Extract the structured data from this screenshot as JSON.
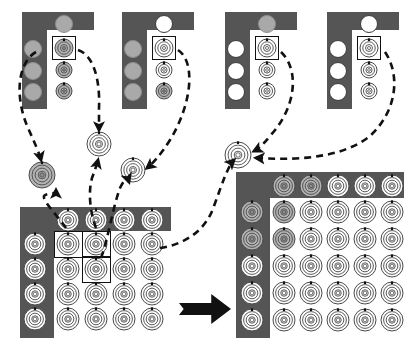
{
  "figure": {
    "type": "process-diagram",
    "canvas": {
      "width": 414,
      "height": 347
    },
    "background": "#ffffff"
  },
  "colors": {
    "panel_dark": "#555556",
    "panel_light": "#ffffff",
    "circle_gray": "#a9a9aa",
    "circle_white": "#ffffff",
    "ring_stroke": "#4a4a4a",
    "ring_fill_gray": "#b3b3b4",
    "ring_fill_white": "#ffffff",
    "arrow_black": "#111111",
    "selection_box": "#111111"
  },
  "legend_glyphs": {
    "plain_circle": "filled-circle",
    "ring_node": "concentric-ring-node",
    "ellipsis": "...",
    "transform_arrow": "thick-right-arrow"
  },
  "panels": [
    {
      "id": "panel-1",
      "label": "candidate-panel-1",
      "x": 22,
      "y": 12,
      "w": 72,
      "h": 97,
      "white_x": 25,
      "white_y": 18,
      "white_w": 47,
      "white_h": 79,
      "column_dots": [
        {
          "style": "gray",
          "cx": 11,
          "cy": 37,
          "r": 9
        },
        {
          "style": "gray",
          "cx": 11,
          "cy": 59,
          "r": 9
        },
        {
          "style": "gray",
          "cx": 11,
          "cy": 80,
          "r": 9
        }
      ],
      "top_dot": {
        "style": "gray",
        "cx": 42,
        "cy": 12,
        "r": 9
      },
      "ring_nodes": [
        {
          "fill": "gray",
          "cx": 42,
          "cy": 36,
          "r": 9,
          "selected": true
        },
        {
          "fill": "gray",
          "cx": 42,
          "cy": 58,
          "r": 8
        },
        {
          "fill": "gray",
          "cx": 42,
          "cy": 79,
          "r": 8
        }
      ],
      "ellipsis_dark": {
        "x": 3,
        "y": 88
      },
      "ellipsis_light": {
        "x": 34,
        "y": 87
      }
    },
    {
      "id": "panel-2",
      "label": "candidate-panel-2",
      "x": 122,
      "y": 12,
      "w": 72,
      "h": 97,
      "white_x": 25,
      "white_y": 18,
      "white_w": 47,
      "white_h": 79,
      "column_dots": [
        {
          "style": "gray",
          "cx": 11,
          "cy": 37,
          "r": 9
        },
        {
          "style": "gray",
          "cx": 11,
          "cy": 59,
          "r": 9
        },
        {
          "style": "gray",
          "cx": 11,
          "cy": 80,
          "r": 9
        }
      ],
      "top_dot": {
        "style": "white",
        "cx": 42,
        "cy": 12,
        "r": 9
      },
      "ring_nodes": [
        {
          "fill": "white",
          "cx": 42,
          "cy": 36,
          "r": 9,
          "selected": true
        },
        {
          "fill": "white",
          "cx": 42,
          "cy": 58,
          "r": 8
        },
        {
          "fill": "gray",
          "cx": 42,
          "cy": 79,
          "r": 8
        }
      ],
      "ellipsis_dark": {
        "x": 3,
        "y": 88
      },
      "ellipsis_light": {
        "x": 34,
        "y": 87
      }
    },
    {
      "id": "panel-3",
      "label": "candidate-panel-3",
      "x": 225,
      "y": 12,
      "w": 72,
      "h": 97,
      "white_x": 25,
      "white_y": 18,
      "white_w": 47,
      "white_h": 79,
      "column_dots": [
        {
          "style": "white",
          "cx": 11,
          "cy": 37,
          "r": 9
        },
        {
          "style": "white",
          "cx": 11,
          "cy": 59,
          "r": 9
        },
        {
          "style": "white",
          "cx": 11,
          "cy": 80,
          "r": 9
        }
      ],
      "top_dot": {
        "style": "gray",
        "cx": 42,
        "cy": 12,
        "r": 9
      },
      "ring_nodes": [
        {
          "fill": "white",
          "cx": 42,
          "cy": 36,
          "r": 9,
          "selected": true
        },
        {
          "fill": "white",
          "cx": 42,
          "cy": 58,
          "r": 8
        },
        {
          "fill": "white",
          "cx": 42,
          "cy": 79,
          "r": 8
        }
      ],
      "ellipsis_dark": {
        "x": 3,
        "y": 88
      },
      "ellipsis_light": {
        "x": 34,
        "y": 87
      }
    },
    {
      "id": "panel-4",
      "label": "candidate-panel-4",
      "x": 327,
      "y": 12,
      "w": 72,
      "h": 97,
      "white_x": 25,
      "white_y": 18,
      "white_w": 47,
      "white_h": 79,
      "column_dots": [
        {
          "style": "white",
          "cx": 11,
          "cy": 37,
          "r": 9
        },
        {
          "style": "white",
          "cx": 11,
          "cy": 59,
          "r": 9
        },
        {
          "style": "white",
          "cx": 11,
          "cy": 80,
          "r": 9
        }
      ],
      "top_dot": {
        "style": "white",
        "cx": 42,
        "cy": 12,
        "r": 9
      },
      "ring_nodes": [
        {
          "fill": "white",
          "cx": 42,
          "cy": 36,
          "r": 9,
          "selected": true
        },
        {
          "fill": "white",
          "cx": 42,
          "cy": 58,
          "r": 8
        },
        {
          "fill": "white",
          "cx": 42,
          "cy": 79,
          "r": 8
        }
      ],
      "ellipsis_dark": {
        "x": 3,
        "y": 88
      },
      "ellipsis_light": {
        "x": 34,
        "y": 87
      }
    }
  ],
  "intermediate_nodes": [
    {
      "id": "node-a",
      "label": "selected-node-a",
      "cx": 42,
      "cy": 175,
      "r": 13,
      "fill": "gray"
    },
    {
      "id": "node-b",
      "label": "selected-node-b",
      "cx": 99,
      "cy": 144,
      "r": 12,
      "fill": "white"
    },
    {
      "id": "node-c",
      "label": "selected-node-c",
      "cx": 133,
      "cy": 170,
      "r": 12,
      "fill": "white"
    },
    {
      "id": "node-d",
      "label": "selected-node-d",
      "cx": 238,
      "cy": 155,
      "r": 13,
      "fill": "white"
    }
  ],
  "matrix_left": {
    "id": "matrix-source",
    "label": "source-matrix-4x4",
    "x": 20,
    "y": 207,
    "w": 151,
    "h": 131,
    "rows": 4,
    "cols": 4,
    "inner_x": 34,
    "inner_y": 24,
    "inner_w": 117,
    "inner_h": 107,
    "header_top_cy": 13,
    "header_left_cx": 15,
    "cell_w": 28,
    "cell_h": 25,
    "cell_origin_x": 48,
    "cell_origin_y": 37,
    "node_r": 11,
    "header_top_fill": [
      "white",
      "white",
      "white",
      "white"
    ],
    "header_left_fill": [
      "white",
      "white",
      "white",
      "white"
    ],
    "cell_fill": [
      [
        "white",
        "white",
        "white",
        "white"
      ],
      [
        "white",
        "white",
        "white",
        "white"
      ],
      [
        "white",
        "white",
        "white",
        "white"
      ],
      [
        "white",
        "white",
        "white",
        "white"
      ]
    ],
    "selected_cells": [
      {
        "row": 0,
        "col": 0
      },
      {
        "row": 0,
        "col": 1
      },
      {
        "row": 1,
        "col": 1
      }
    ]
  },
  "matrix_right": {
    "id": "matrix-result",
    "label": "result-matrix-5x5",
    "x": 236,
    "y": 172,
    "w": 168,
    "h": 166,
    "rows": 5,
    "cols": 5,
    "inner_x": 34,
    "inner_y": 26,
    "inner_w": 134,
    "inner_h": 140,
    "header_top_cy": 14,
    "header_left_cx": 16,
    "cell_w": 27,
    "cell_h": 27,
    "cell_origin_x": 48,
    "cell_origin_y": 40,
    "node_r": 11,
    "header_top_fill": [
      "gray",
      "gray",
      "white",
      "white",
      "white"
    ],
    "header_left_fill": [
      "gray",
      "gray",
      "white",
      "white",
      "white"
    ],
    "cell_fill": [
      [
        "gray",
        "white",
        "white",
        "white",
        "white"
      ],
      [
        "gray",
        "white",
        "white",
        "white",
        "white"
      ],
      [
        "white",
        "white",
        "white",
        "white",
        "white"
      ],
      [
        "white",
        "white",
        "white",
        "white",
        "white"
      ],
      [
        "white",
        "white",
        "white",
        "white",
        "white"
      ]
    ],
    "selected_cells": []
  },
  "transform_arrow": {
    "label": "transform-arrow",
    "x": 179,
    "y": 294,
    "w": 52,
    "h": 30,
    "direction": "right",
    "color": "#111111"
  },
  "flow_arrows": [
    {
      "id": "f1",
      "from": "panel-1",
      "to": "node-a",
      "d": "M 36,52 C 18,62 14,96 28,128 C 38,150 40,156 41,160"
    },
    {
      "id": "f2",
      "from": "panel-1",
      "to": "node-b",
      "d": "M 78,50 C 96,56 100,86 99,108 C 99,120 99,126 99,130"
    },
    {
      "id": "f3",
      "from": "panel-2",
      "to": "node-c",
      "d": "M 178,50 C 196,62 192,104 170,140 C 160,156 152,164 147,168"
    },
    {
      "id": "f4",
      "from": "panel-3",
      "to": "node-d",
      "d": "M 281,52 C 300,70 296,108 270,136 C 262,146 258,149 254,151"
    },
    {
      "id": "f5",
      "from": "panel-4",
      "to": "node-d",
      "d": "M 385,52 C 400,74 398,110 370,136 C 340,160 290,160 256,158"
    },
    {
      "id": "f6",
      "from": "matrix-left-cell-0-0",
      "to": "node-a",
      "d": "M 66,228 C 56,214 42,200 44,196 C 48,192 56,196 56,190"
    },
    {
      "id": "f7",
      "from": "matrix-left-cell-0-1",
      "to": "node-b",
      "d": "M 96,228 C 90,212 88,192 92,178 C 95,170 97,164 98,160"
    },
    {
      "id": "f8",
      "from": "matrix-left-cell-1-1",
      "to": "node-c",
      "d": "M 101,258 C 108,240 112,210 120,188 C 124,180 127,176 129,182"
    },
    {
      "id": "f9",
      "from": "matrix-left-cell-row1",
      "to": "node-d",
      "d": "M 160,248 C 186,244 206,230 214,206 C 222,184 228,166 234,160"
    }
  ],
  "arrow_style": {
    "stroke": "#111111",
    "width": 2.6,
    "dash": "7 5",
    "head": "filled-triangle"
  }
}
